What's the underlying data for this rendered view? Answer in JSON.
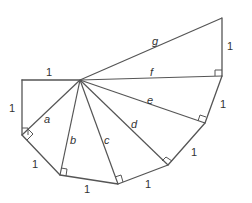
{
  "diagram": {
    "side_labels": {
      "top_left": "1",
      "left": "1",
      "lower_left": "1",
      "bottom": "1",
      "bottom_right": "1",
      "right_lower": "1",
      "right_middle": "1",
      "right_top": "1"
    },
    "hypotenuse_labels": {
      "a": "a",
      "b": "b",
      "c": "c",
      "d": "d",
      "e": "e",
      "f": "f",
      "g": "g"
    },
    "colors": {
      "line": "#555555",
      "text": "#333333",
      "background": "#ffffff"
    }
  }
}
